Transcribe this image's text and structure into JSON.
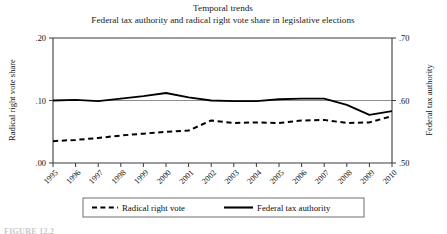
{
  "figure": {
    "caption_partial": "FIGURE 12.2"
  },
  "chart_data": {
    "type": "line",
    "title": "Temporal trends",
    "subtitle": "Federal tax authority and radical right vote share in legislative elections",
    "xlabel": "",
    "ylabel": "Radical right vote share",
    "y2label": "Federal tax authority",
    "x": [
      1995,
      1996,
      1997,
      1998,
      1999,
      2000,
      2001,
      2002,
      2003,
      2004,
      2005,
      2006,
      2007,
      2008,
      2009,
      2010
    ],
    "categories": [
      "1995",
      "1996",
      "1997",
      "1998",
      "1999",
      "2000",
      "2001",
      "2002",
      "2003",
      "2004",
      "2005",
      "2006",
      "2007",
      "2008",
      "2009",
      "2010"
    ],
    "xlim": [
      1995,
      2010
    ],
    "ylim": [
      0.0,
      0.2
    ],
    "y2lim": [
      0.5,
      0.7
    ],
    "yticks": [
      0.0,
      0.1,
      0.2
    ],
    "ytick_labels": [
      ".00",
      ".10",
      ".20"
    ],
    "y2ticks": [
      0.5,
      0.6,
      0.7
    ],
    "y2tick_labels": [
      ".50",
      ".60",
      ".70"
    ],
    "grid": true,
    "gridlines": [
      0.1
    ],
    "legend_position": "bottom",
    "series": [
      {
        "name": "Radical right vote",
        "axis": "left",
        "style": "dashed",
        "color": "#000000",
        "values": [
          0.035,
          0.037,
          0.04,
          0.044,
          0.047,
          0.05,
          0.052,
          0.068,
          0.064,
          0.065,
          0.064,
          0.068,
          0.069,
          0.064,
          0.065,
          0.075
        ]
      },
      {
        "name": "Federal tax authority",
        "axis": "right",
        "style": "solid",
        "color": "#000000",
        "values": [
          0.6,
          0.601,
          0.599,
          0.603,
          0.607,
          0.612,
          0.605,
          0.6,
          0.599,
          0.599,
          0.602,
          0.603,
          0.603,
          0.593,
          0.577,
          0.583
        ]
      }
    ]
  },
  "legend": {
    "items": [
      {
        "label": "Radical right vote",
        "style": "dashed"
      },
      {
        "label": "Federal tax authority",
        "style": "solid"
      }
    ]
  }
}
